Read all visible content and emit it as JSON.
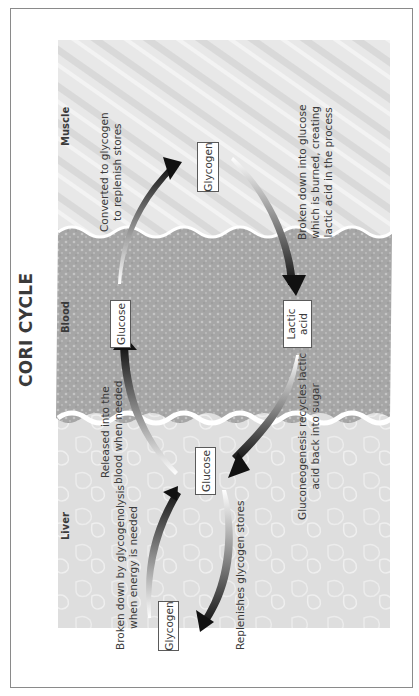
{
  "title": "CORI CYCLE",
  "orientation": "rotated 90deg counter-clockwise",
  "regions": [
    {
      "id": "muscle",
      "label": "Muscle",
      "fill": "#e6e6e6"
    },
    {
      "id": "blood",
      "label": "Blood",
      "fill": "#a9a9a9"
    },
    {
      "id": "liver",
      "label": "Liver",
      "fill": "#dcdcdc"
    }
  ],
  "nodes": {
    "muscle_glycogen": "Glycogen",
    "blood_glucose": "Glucose",
    "blood_lactic_acid_line1": "Lactic",
    "blood_lactic_acid_line2": "acid",
    "liver_glucose": "Glucose",
    "liver_glycogen": "Glycogen"
  },
  "annotations": {
    "converted_line1": "Converted to glycogen",
    "converted_line2": "to replenish stores",
    "broken_muscle_line1": "Broken down into glucose",
    "broken_muscle_line2": "which is burned, creating",
    "broken_muscle_line3": "lactic acid in the process",
    "released_line1": "Released into the",
    "released_line2": "blood when needed",
    "gluconeogenesis_line1": "Gluconeogenesis recycles lactic",
    "gluconeogenesis_line2": "acid back into sugar",
    "broken_liver_line1": "Broken down by glycogenolysis",
    "broken_liver_line2": "when energy is needed",
    "replenishes": "Replenishes glycogen stores"
  },
  "colors": {
    "frame_border": "#8a8a8a",
    "box_border": "#5a5a5a",
    "arrow_dark": "#1a1a1a",
    "text": "#3a3a3a"
  }
}
